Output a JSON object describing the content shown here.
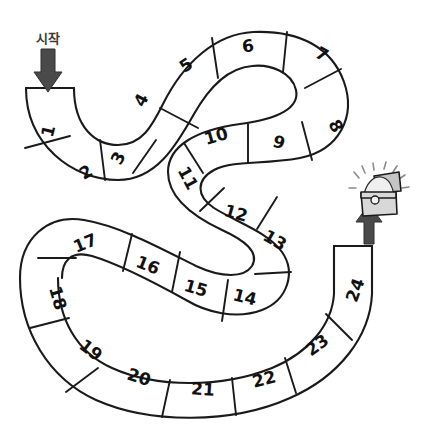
{
  "board": {
    "title": "serpentine-board-game-track",
    "start_label": "시작",
    "total_cells": 24,
    "line_color": "#1a1a1a",
    "fill_color": "#ffffff",
    "arrow_color": "#4a4a4a",
    "background": "#ffffff"
  },
  "start_marker": {
    "label": "시작",
    "icon": "arrow-down-icon",
    "points_to_cell": "1"
  },
  "end_marker": {
    "icon": "arrow-up-icon",
    "points_to_cell": "24",
    "reward_icon": "treasure-chest-icon"
  },
  "cells": [
    {
      "n": "1",
      "x": 48,
      "y": 131,
      "rot": -76
    },
    {
      "n": "2",
      "x": 86,
      "y": 172,
      "rot": -30
    },
    {
      "n": "3",
      "x": 118,
      "y": 158,
      "rot": -62
    },
    {
      "n": "4",
      "x": 141,
      "y": 100,
      "rot": -62
    },
    {
      "n": "5",
      "x": 186,
      "y": 65,
      "rot": -33
    },
    {
      "n": "6",
      "x": 248,
      "y": 46,
      "rot": -9
    },
    {
      "n": "7",
      "x": 322,
      "y": 54,
      "rot": 28
    },
    {
      "n": "8",
      "x": 336,
      "y": 126,
      "rot": 62
    },
    {
      "n": "9",
      "x": 279,
      "y": 142,
      "rot": 16
    },
    {
      "n": "10",
      "x": 216,
      "y": 136,
      "rot": -16
    },
    {
      "n": "11",
      "x": 188,
      "y": 178,
      "rot": 62
    },
    {
      "n": "12",
      "x": 236,
      "y": 213,
      "rot": 16
    },
    {
      "n": "13",
      "x": 275,
      "y": 240,
      "rot": 30
    },
    {
      "n": "14",
      "x": 245,
      "y": 297,
      "rot": 14
    },
    {
      "n": "15",
      "x": 196,
      "y": 288,
      "rot": 16
    },
    {
      "n": "16",
      "x": 148,
      "y": 265,
      "rot": 22
    },
    {
      "n": "17",
      "x": 85,
      "y": 243,
      "rot": -22
    },
    {
      "n": "18",
      "x": 58,
      "y": 298,
      "rot": 74
    },
    {
      "n": "19",
      "x": 91,
      "y": 350,
      "rot": 38
    },
    {
      "n": "20",
      "x": 139,
      "y": 377,
      "rot": 18
    },
    {
      "n": "21",
      "x": 203,
      "y": 389,
      "rot": 4
    },
    {
      "n": "22",
      "x": 264,
      "y": 379,
      "rot": -14
    },
    {
      "n": "23",
      "x": 317,
      "y": 345,
      "rot": -36
    },
    {
      "n": "24",
      "x": 355,
      "y": 290,
      "rot": -70
    }
  ]
}
